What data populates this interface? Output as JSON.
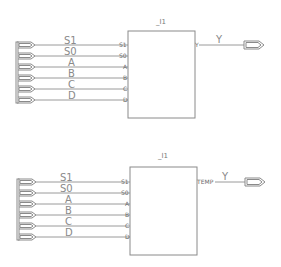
{
  "schematics": [
    {
      "instance_label": "_I1",
      "inputs": [
        {
          "net": "S1",
          "pin": "S1"
        },
        {
          "net": "S0",
          "pin": "S0"
        },
        {
          "net": "A",
          "pin": "A"
        },
        {
          "net": "B",
          "pin": "B"
        },
        {
          "net": "C",
          "pin": "C"
        },
        {
          "net": "D",
          "pin": "D"
        }
      ],
      "output": {
        "pin": "Y",
        "net": "Y"
      }
    },
    {
      "instance_label": "_I1",
      "inputs": [
        {
          "net": "S1",
          "pin": "S1"
        },
        {
          "net": "S0",
          "pin": "S0"
        },
        {
          "net": "A",
          "pin": "A"
        },
        {
          "net": "B",
          "pin": "B"
        },
        {
          "net": "C",
          "pin": "C"
        },
        {
          "net": "D",
          "pin": "D"
        }
      ],
      "output": {
        "pin": "TEMP",
        "net": "Y"
      }
    }
  ]
}
